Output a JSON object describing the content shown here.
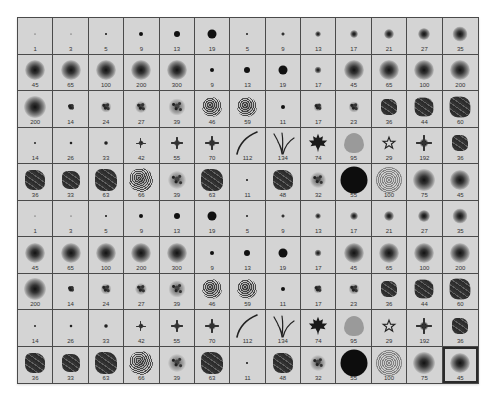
{
  "panel": {
    "title": "Brush Preset Picker",
    "columns": 13,
    "rows": 10,
    "selected_index": 129,
    "colors": {
      "cell_background": "#d4d4d4",
      "grid_line": "#4a4a4a",
      "label_text": "#333333",
      "brush_ink": "#111111"
    }
  },
  "brushes": [
    {
      "size": "1",
      "type": "hard",
      "d": 1
    },
    {
      "size": "3",
      "type": "hard",
      "d": 1
    },
    {
      "size": "5",
      "type": "hard",
      "d": 2
    },
    {
      "size": "9",
      "type": "hard",
      "d": 4
    },
    {
      "size": "13",
      "type": "hard",
      "d": 6
    },
    {
      "size": "19",
      "type": "hard",
      "d": 9
    },
    {
      "size": "5",
      "type": "soft",
      "d": 3
    },
    {
      "size": "9",
      "type": "soft",
      "d": 4
    },
    {
      "size": "13",
      "type": "soft",
      "d": 6
    },
    {
      "size": "17",
      "type": "soft",
      "d": 8
    },
    {
      "size": "21",
      "type": "soft",
      "d": 10
    },
    {
      "size": "27",
      "type": "soft",
      "d": 12
    },
    {
      "size": "35",
      "type": "soft",
      "d": 15
    },
    {
      "size": "45",
      "type": "soft",
      "d": 20
    },
    {
      "size": "65",
      "type": "soft",
      "d": 20
    },
    {
      "size": "100",
      "type": "soft",
      "d": 20
    },
    {
      "size": "200",
      "type": "soft",
      "d": 20
    },
    {
      "size": "300",
      "type": "soft",
      "d": 20
    },
    {
      "size": "9",
      "type": "hard",
      "d": 4
    },
    {
      "size": "13",
      "type": "hard",
      "d": 6
    },
    {
      "size": "19",
      "type": "hard",
      "d": 9
    },
    {
      "size": "17",
      "type": "soft",
      "d": 7
    },
    {
      "size": "45",
      "type": "soft",
      "d": 20
    },
    {
      "size": "65",
      "type": "soft",
      "d": 20
    },
    {
      "size": "100",
      "type": "soft",
      "d": 20
    },
    {
      "size": "200",
      "type": "soft",
      "d": 20
    },
    {
      "size": "200",
      "type": "soft",
      "d": 22
    },
    {
      "size": "14",
      "type": "scatter",
      "d": 7
    },
    {
      "size": "24",
      "type": "scatter",
      "d": 11
    },
    {
      "size": "27",
      "type": "scatter",
      "d": 12
    },
    {
      "size": "39",
      "type": "scatter",
      "d": 17
    },
    {
      "size": "46",
      "type": "noise",
      "d": 20
    },
    {
      "size": "59",
      "type": "noise",
      "d": 20
    },
    {
      "size": "11",
      "type": "hard",
      "d": 4
    },
    {
      "size": "17",
      "type": "scatter",
      "d": 9
    },
    {
      "size": "23",
      "type": "scatter",
      "d": 11
    },
    {
      "size": "36",
      "type": "textured",
      "d": 16
    },
    {
      "size": "44",
      "type": "textured",
      "d": 19
    },
    {
      "size": "60",
      "type": "textured",
      "d": 21
    },
    {
      "size": "14",
      "type": "star8",
      "d": 4
    },
    {
      "size": "26",
      "type": "star8",
      "d": 6
    },
    {
      "size": "33",
      "type": "star8",
      "d": 8
    },
    {
      "size": "42",
      "type": "star8",
      "d": 10
    },
    {
      "size": "55",
      "type": "star8",
      "d": 12
    },
    {
      "size": "70",
      "type": "star8",
      "d": 14
    },
    {
      "size": "112",
      "type": "grass-blade",
      "d": 24
    },
    {
      "size": "134",
      "type": "grass-tuft",
      "d": 24
    },
    {
      "size": "74",
      "type": "maple-leaf",
      "d": 20
    },
    {
      "size": "95",
      "type": "leaf",
      "d": 20
    },
    {
      "size": "29",
      "type": "star-outline",
      "d": 14
    },
    {
      "size": "192",
      "type": "star8",
      "d": 16
    },
    {
      "size": "36",
      "type": "textured",
      "d": 16
    },
    {
      "size": "36",
      "type": "textured",
      "d": 20
    },
    {
      "size": "33",
      "type": "textured",
      "d": 18
    },
    {
      "size": "63",
      "type": "textured",
      "d": 22
    },
    {
      "size": "66",
      "type": "noise",
      "d": 24
    },
    {
      "size": "39",
      "type": "scatter",
      "d": 18
    },
    {
      "size": "63",
      "type": "textured",
      "d": 22
    },
    {
      "size": "11",
      "type": "hard",
      "d": 2
    },
    {
      "size": "48",
      "type": "textured",
      "d": 20
    },
    {
      "size": "32",
      "type": "scatter",
      "d": 16
    },
    {
      "size": "55",
      "type": "bigdisc",
      "d": 27
    },
    {
      "size": "100",
      "type": "speckle",
      "d": 26
    },
    {
      "size": "75",
      "type": "soft",
      "d": 22
    },
    {
      "size": "45",
      "type": "soft",
      "d": 20
    },
    {
      "size": "1",
      "type": "hard",
      "d": 1
    },
    {
      "size": "3",
      "type": "hard",
      "d": 1
    },
    {
      "size": "5",
      "type": "hard",
      "d": 2
    },
    {
      "size": "9",
      "type": "hard",
      "d": 4
    },
    {
      "size": "13",
      "type": "hard",
      "d": 6
    },
    {
      "size": "19",
      "type": "hard",
      "d": 9
    },
    {
      "size": "5",
      "type": "soft",
      "d": 3
    },
    {
      "size": "9",
      "type": "soft",
      "d": 4
    },
    {
      "size": "13",
      "type": "soft",
      "d": 6
    },
    {
      "size": "17",
      "type": "soft",
      "d": 8
    },
    {
      "size": "21",
      "type": "soft",
      "d": 10
    },
    {
      "size": "27",
      "type": "soft",
      "d": 12
    },
    {
      "size": "35",
      "type": "soft",
      "d": 15
    },
    {
      "size": "45",
      "type": "soft",
      "d": 20
    },
    {
      "size": "65",
      "type": "soft",
      "d": 20
    },
    {
      "size": "100",
      "type": "soft",
      "d": 20
    },
    {
      "size": "200",
      "type": "soft",
      "d": 20
    },
    {
      "size": "300",
      "type": "soft",
      "d": 20
    },
    {
      "size": "9",
      "type": "hard",
      "d": 4
    },
    {
      "size": "13",
      "type": "hard",
      "d": 6
    },
    {
      "size": "19",
      "type": "hard",
      "d": 9
    },
    {
      "size": "17",
      "type": "soft",
      "d": 7
    },
    {
      "size": "45",
      "type": "soft",
      "d": 20
    },
    {
      "size": "65",
      "type": "soft",
      "d": 20
    },
    {
      "size": "100",
      "type": "soft",
      "d": 20
    },
    {
      "size": "200",
      "type": "soft",
      "d": 20
    },
    {
      "size": "200",
      "type": "soft",
      "d": 22
    },
    {
      "size": "14",
      "type": "scatter",
      "d": 7
    },
    {
      "size": "24",
      "type": "scatter",
      "d": 11
    },
    {
      "size": "27",
      "type": "scatter",
      "d": 12
    },
    {
      "size": "39",
      "type": "scatter",
      "d": 17
    },
    {
      "size": "46",
      "type": "noise",
      "d": 20
    },
    {
      "size": "59",
      "type": "noise",
      "d": 20
    },
    {
      "size": "11",
      "type": "hard",
      "d": 4
    },
    {
      "size": "17",
      "type": "scatter",
      "d": 9
    },
    {
      "size": "23",
      "type": "scatter",
      "d": 11
    },
    {
      "size": "36",
      "type": "textured",
      "d": 16
    },
    {
      "size": "44",
      "type": "textured",
      "d": 19
    },
    {
      "size": "60",
      "type": "textured",
      "d": 21
    },
    {
      "size": "14",
      "type": "star8",
      "d": 4
    },
    {
      "size": "26",
      "type": "star8",
      "d": 6
    },
    {
      "size": "33",
      "type": "star8",
      "d": 8
    },
    {
      "size": "42",
      "type": "star8",
      "d": 10
    },
    {
      "size": "55",
      "type": "star8",
      "d": 12
    },
    {
      "size": "70",
      "type": "star8",
      "d": 14
    },
    {
      "size": "112",
      "type": "grass-blade",
      "d": 24
    },
    {
      "size": "134",
      "type": "grass-tuft",
      "d": 24
    },
    {
      "size": "74",
      "type": "maple-leaf",
      "d": 20
    },
    {
      "size": "95",
      "type": "leaf",
      "d": 20
    },
    {
      "size": "29",
      "type": "star-outline",
      "d": 14
    },
    {
      "size": "192",
      "type": "star8",
      "d": 16
    },
    {
      "size": "36",
      "type": "textured",
      "d": 16
    },
    {
      "size": "36",
      "type": "textured",
      "d": 20
    },
    {
      "size": "33",
      "type": "textured",
      "d": 18
    },
    {
      "size": "63",
      "type": "textured",
      "d": 22
    },
    {
      "size": "66",
      "type": "noise",
      "d": 24
    },
    {
      "size": "39",
      "type": "scatter",
      "d": 18
    },
    {
      "size": "63",
      "type": "textured",
      "d": 22
    },
    {
      "size": "11",
      "type": "hard",
      "d": 2
    },
    {
      "size": "48",
      "type": "textured",
      "d": 20
    },
    {
      "size": "32",
      "type": "scatter",
      "d": 16
    },
    {
      "size": "55",
      "type": "bigdisc",
      "d": 27
    },
    {
      "size": "100",
      "type": "speckle",
      "d": 26
    },
    {
      "size": "75",
      "type": "soft",
      "d": 22
    },
    {
      "size": "45",
      "type": "soft",
      "d": 20
    }
  ]
}
